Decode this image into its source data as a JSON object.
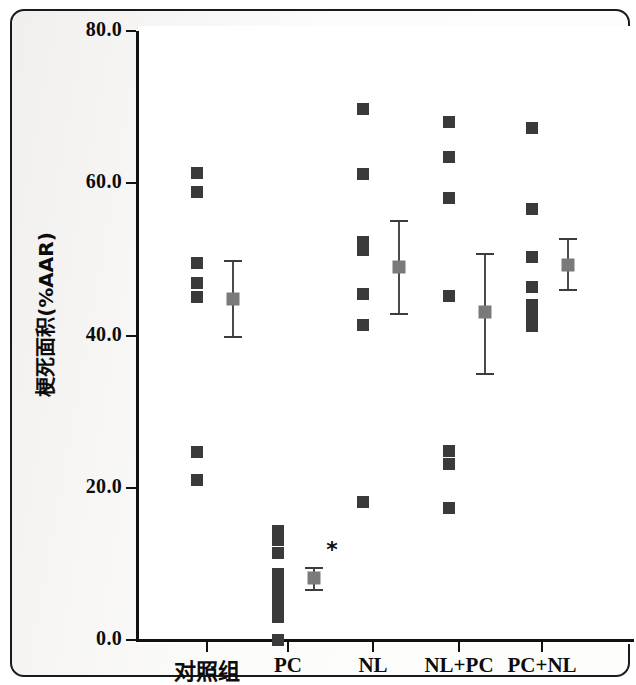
{
  "figure": {
    "kind": "scatter-dot-plot-with-mean-sem",
    "background_color": "#ffffff",
    "paper_tint": "#f5f4f2",
    "point_color": "#3a3a3a",
    "mean_color": "#7a7a7a",
    "axis_color": "#111111",
    "significance_symbol": "*"
  },
  "axes": {
    "y_title": "梗死面积(%AAR)",
    "y_ticks": [
      "80.0",
      "60.0",
      "40.0",
      "20.0",
      "0.0"
    ],
    "y_tick_values": [
      80,
      60,
      40,
      20,
      0
    ],
    "x_categories": [
      "对照组",
      "PC",
      "NL",
      "NL+PC",
      "PC+NL"
    ]
  },
  "chart_data": {
    "type": "scatter",
    "title": "",
    "xlabel": "",
    "ylabel": "梗死面积(%AAR)",
    "ylim": [
      0,
      80
    ],
    "yticks": [
      0,
      20,
      40,
      60,
      80
    ],
    "grid": false,
    "legend": null,
    "categories": [
      "对照组",
      "PC",
      "NL",
      "NL+PC",
      "PC+NL"
    ],
    "groups": [
      {
        "name": "对照组",
        "points": [
          61.4,
          58.9,
          49.5,
          46.9,
          45.1,
          24.7,
          21.0
        ],
        "mean": 44.8,
        "sem_upper": 49.8,
        "sem_lower": 39.8,
        "significant": false
      },
      {
        "name": "PC",
        "points": [
          14.3,
          13.2,
          11.4,
          8.7,
          7.1,
          6.0,
          4.5,
          3.0,
          0.0
        ],
        "mean": 8.1,
        "sem_upper": 9.5,
        "sem_lower": 6.6,
        "significant": true
      },
      {
        "name": "NL",
        "points": [
          69.8,
          61.2,
          52.3,
          51.2,
          45.5,
          41.4,
          18.1
        ],
        "mean": 49.0,
        "sem_upper": 55.0,
        "sem_lower": 42.8,
        "significant": false
      },
      {
        "name": "NL+PC",
        "points": [
          68.1,
          63.5,
          58.1,
          45.2,
          24.8,
          23.1,
          17.3
        ],
        "mean": 43.1,
        "sem_upper": 50.7,
        "sem_lower": 34.9,
        "significant": false
      },
      {
        "name": "PC+NL",
        "points": [
          67.3,
          56.6,
          50.3,
          46.4,
          44.0,
          42.6,
          41.3
        ],
        "mean": 49.3,
        "sem_upper": 52.7,
        "sem_lower": 46.0,
        "significant": false
      }
    ]
  },
  "layout": {
    "plot_left_px": 136,
    "plot_right_px": 634,
    "y_top_px": 31,
    "y_bottom_px": 640,
    "group_centers_px": [
      207,
      288,
      373,
      459,
      542
    ],
    "point_offset_px": -10,
    "mean_offset_px": 26,
    "star_offset_px": 44,
    "star_y_value": 11.8
  }
}
